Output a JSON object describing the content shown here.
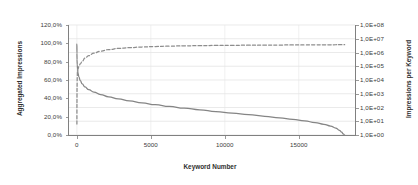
{
  "chart_data": {
    "type": "line",
    "title": "",
    "xlabel": "Keyword Number",
    "ylabel": "Aggregated Impressions",
    "y2label": "Impressions per Keyword",
    "grid": true,
    "legend": "none",
    "xlim": [
      -600,
      18800
    ],
    "xticks": [
      0,
      5000,
      10000,
      15000
    ],
    "xticklabels": [
      "0",
      "5000",
      "10000",
      "15000"
    ],
    "ylim": [
      0,
      1.2
    ],
    "yticks": [
      0,
      0.2,
      0.4,
      0.6,
      0.8,
      1.0,
      1.2
    ],
    "yticklabels": [
      "0,0%",
      "20,0%",
      "40,0%",
      "60,0%",
      "80,0%",
      "100,0%",
      "120,0%"
    ],
    "y2lim": [
      1,
      100000000
    ],
    "y2scale": "log",
    "y2ticks": [
      1,
      10,
      100,
      1000,
      10000,
      100000,
      1000000,
      10000000,
      100000000
    ],
    "y2ticklabels": [
      "1,0E+00",
      "1,0E+01",
      "1,0E+02",
      "1,0E+03",
      "1,0E+04",
      "1,0E+05",
      "1,0E+06",
      "1,0E+07",
      "1,0E+08"
    ],
    "series": [
      {
        "name": "Impressions per Keyword",
        "axis": "right",
        "style": "solid",
        "color": "#858585",
        "x": [
          1,
          5,
          12,
          25,
          45,
          80,
          140,
          230,
          360,
          550,
          800,
          1150,
          1600,
          2150,
          2800,
          3550,
          4400,
          5300,
          6250,
          7250,
          8300,
          9400,
          10500,
          11600,
          12700,
          13700,
          14600,
          15400,
          16100,
          16700,
          17150,
          17500,
          17750,
          17900,
          18000,
          18100
        ],
        "y": [
          4000000,
          900000,
          300000,
          130000,
          62000,
          30000,
          16000,
          9000,
          5200,
          3100,
          2000,
          1300,
          880,
          600,
          420,
          300,
          215,
          160,
          120,
          90,
          68,
          51,
          39,
          30,
          23,
          17.5,
          13.5,
          10.5,
          8,
          6,
          4.5,
          3.2,
          2.2,
          1.6,
          1.2,
          1
        ]
      },
      {
        "name": "Aggregated Impressions",
        "axis": "left",
        "style": "dashed",
        "color": "#8d8d8d",
        "x": [
          1,
          5,
          12,
          25,
          45,
          80,
          140,
          230,
          360,
          550,
          800,
          1150,
          1600,
          2150,
          2800,
          3550,
          4400,
          5300,
          6250,
          7250,
          8300,
          9400,
          10500,
          11600,
          12700,
          13700,
          14600,
          15400,
          16100,
          16700,
          17150,
          17500,
          17750,
          17900,
          18000,
          18100
        ],
        "y": [
          0.12,
          0.35,
          0.52,
          0.63,
          0.69,
          0.722,
          0.748,
          0.775,
          0.805,
          0.838,
          0.866,
          0.893,
          0.915,
          0.932,
          0.944,
          0.953,
          0.96,
          0.9655,
          0.9695,
          0.9725,
          0.9748,
          0.9768,
          0.9784,
          0.9797,
          0.9808,
          0.9817,
          0.9824,
          0.983,
          0.9835,
          0.9839,
          0.9842,
          0.9845,
          0.9847,
          0.9848,
          0.9849,
          0.985
        ]
      }
    ]
  }
}
